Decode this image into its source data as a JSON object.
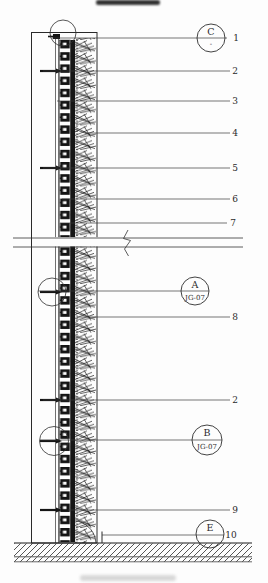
{
  "drawing": {
    "type": "architectural-section-detail",
    "colors": {
      "ink": "#1f1f1f",
      "paper": "#fdfdfd"
    },
    "callouts": [
      {
        "label": "1"
      },
      {
        "label": "2"
      },
      {
        "label": "3"
      },
      {
        "label": "4"
      },
      {
        "label": "5"
      },
      {
        "label": "6"
      },
      {
        "label": "7"
      },
      {
        "label": "8"
      },
      {
        "label": "2"
      },
      {
        "label": "9"
      },
      {
        "label": "10"
      }
    ],
    "ref_bubbles": [
      {
        "letter": "C",
        "code": "-"
      },
      {
        "letter": "A",
        "code": "JG-07"
      },
      {
        "letter": "B",
        "code": "JG-07"
      },
      {
        "letter": "E",
        "code": ""
      }
    ]
  }
}
